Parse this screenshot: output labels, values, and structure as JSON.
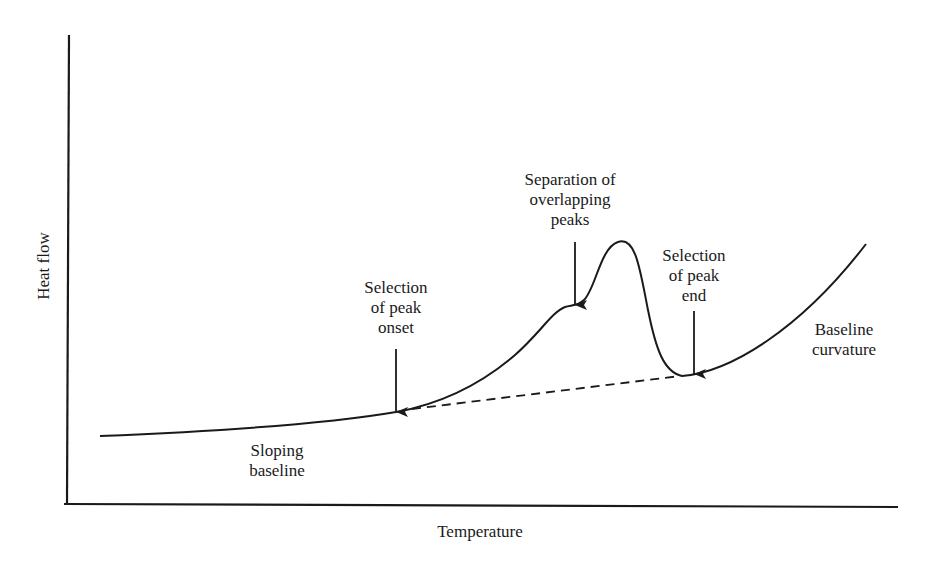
{
  "diagram": {
    "type": "DSC thermogram schematic",
    "axes": {
      "x_label": "Temperature",
      "y_label": "Heat flow"
    },
    "annotations": {
      "peak_onset": {
        "lines": [
          "Selection",
          "of peak",
          "onset"
        ]
      },
      "overlapping_peaks": {
        "lines": [
          "Separation of",
          "overlapping",
          "peaks"
        ]
      },
      "peak_end": {
        "lines": [
          "Selection",
          "of peak",
          "end"
        ]
      },
      "sloping_baseline": {
        "lines": [
          "Sloping",
          "baseline"
        ]
      },
      "baseline_curvature": {
        "lines": [
          "Baseline",
          "curvature"
        ]
      }
    },
    "colors": {
      "ink": "#1a1a1a",
      "background": "#ffffff"
    }
  }
}
